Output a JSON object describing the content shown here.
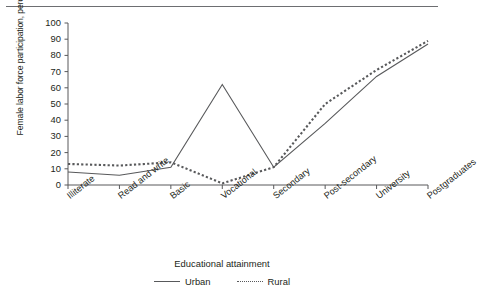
{
  "chart_data": {
    "type": "line",
    "title": "",
    "xlabel": "Educational attainment",
    "ylabel": "Female labor force participation, percentage",
    "categories": [
      "Illiterate",
      "Read and write",
      "Basic",
      "Vocational",
      "Secondary",
      "Post-secondary",
      "University",
      "Postgraduates"
    ],
    "series": [
      {
        "name": "Urban",
        "style": "solid",
        "values": [
          8,
          6,
          11,
          62,
          11,
          38,
          67,
          87
        ]
      },
      {
        "name": "Rural",
        "style": "dashed",
        "values": [
          13,
          12,
          14,
          1,
          11,
          50,
          71,
          89
        ]
      }
    ],
    "ylim": [
      0,
      100
    ],
    "yticks": [
      0,
      10,
      20,
      30,
      40,
      50,
      60,
      70,
      80,
      90,
      100
    ],
    "ytick_labels": [
      "0",
      "10",
      "20",
      "30",
      "40",
      "50",
      "60",
      "70",
      "80",
      "90",
      "100"
    ],
    "grid": false,
    "legend_position": "bottom",
    "line_color": "#58595b"
  },
  "legend": {
    "entries": [
      {
        "label": "Urban"
      },
      {
        "label": "Rural"
      }
    ]
  }
}
